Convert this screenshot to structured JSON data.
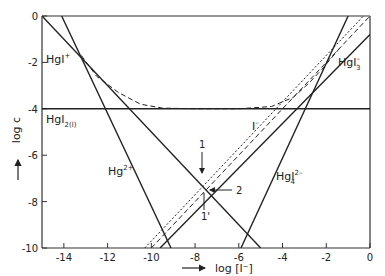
{
  "chart_data": {
    "type": "line",
    "title": "",
    "xlabel": "log [I⁻]",
    "ylabel": "log c",
    "xlim": [
      -15,
      0
    ],
    "ylim": [
      -10,
      0
    ],
    "xticks": [
      -14,
      -12,
      -10,
      -8,
      -6,
      -4,
      -2,
      0
    ],
    "yticks": [
      0,
      -2,
      -4,
      -6,
      -8,
      -10
    ],
    "xtick_labels": [
      "-14",
      "-12",
      "-10",
      "-8",
      "-6",
      "-4",
      "-2",
      "0"
    ],
    "ytick_labels": [
      "0",
      "-2",
      "-4",
      "-6",
      "-8",
      "-10"
    ],
    "grid": false,
    "series": [
      {
        "name": "HgI⁺",
        "style": "solid",
        "points": [
          [
            -15,
            0
          ],
          [
            -5,
            -10
          ]
        ]
      },
      {
        "name": "Hg²⁺",
        "style": "solid",
        "points": [
          [
            -14.1,
            0
          ],
          [
            -9.1,
            -10
          ]
        ]
      },
      {
        "name": "HgI₂(l)",
        "style": "solid",
        "points": [
          [
            -15,
            -4
          ],
          [
            0,
            -4
          ]
        ]
      },
      {
        "name": "HgI₃⁻",
        "style": "solid",
        "points": [
          [
            -9.6,
            -10
          ],
          [
            0,
            -0.8
          ]
        ]
      },
      {
        "name": "HgI₄²⁻",
        "style": "solid",
        "points": [
          [
            -5.9,
            -10
          ],
          [
            -1.0,
            0
          ]
        ]
      },
      {
        "name": "I⁻",
        "style": "dashed",
        "points": [
          [
            -10,
            -10
          ],
          [
            0,
            0
          ]
        ]
      },
      {
        "name": "I⁻ (second)",
        "style": "dotted",
        "points": [
          [
            -10.3,
            -10
          ],
          [
            -0.3,
            0
          ]
        ]
      },
      {
        "name": "total Hg (envelope)",
        "style": "dashed",
        "points": [
          [
            -13.2,
            -1.7
          ],
          [
            -12.5,
            -2.6
          ],
          [
            -11.5,
            -3.3
          ],
          [
            -10.5,
            -3.8
          ],
          [
            -9.5,
            -3.97
          ],
          [
            -8,
            -4.0
          ],
          [
            -6,
            -4.0
          ],
          [
            -4.5,
            -3.9
          ],
          [
            -3.5,
            -3.5
          ],
          [
            -2.8,
            -2.9
          ],
          [
            -2.2,
            -2.3
          ],
          [
            -1.4,
            -1.4
          ]
        ]
      }
    ],
    "annotations": [
      {
        "text": "HgI⁺",
        "x": -14.9,
        "y": -1.9
      },
      {
        "text": "HgI₂(l)",
        "x": -14.9,
        "y": -4.6
      },
      {
        "text": "Hg²⁺",
        "x": -11.3,
        "y": -6.8
      },
      {
        "text": "I⁻",
        "x": -4.6,
        "y": -5.0
      },
      {
        "text": "HgI₃⁻",
        "x": -1.3,
        "y": -2.0
      },
      {
        "text": "HgI₄²⁻",
        "x": -5.0,
        "y": -7.6
      },
      {
        "text": "1",
        "x": -7.7,
        "y": -6.1,
        "note": "arrow pointing down to intersection"
      },
      {
        "text": "2",
        "x": -6.5,
        "y": -7.6,
        "note": "arrow pointing left to intersection"
      },
      {
        "text": "1'",
        "x": -7.7,
        "y": -9.0,
        "note": "below intersection"
      }
    ]
  },
  "labels": {
    "y_axis": "log c",
    "x_axis": "log [I⁻]",
    "HgI_plus": "HgI",
    "HgI_plus_sup": "+",
    "HgI2": "HgI",
    "HgI2_sub": "2(l)",
    "Hg2": "Hg",
    "Hg2_sup": "2+",
    "Iminus": "I",
    "Iminus_sup": "–",
    "HgI3": "HgI",
    "HgI3_sub": "3",
    "HgI3_sup": "–",
    "HgI4": "HgI",
    "HgI4_sub": "4",
    "HgI4_sup": "2–",
    "marker1": "1",
    "marker2": "2",
    "marker1p": "1'"
  }
}
